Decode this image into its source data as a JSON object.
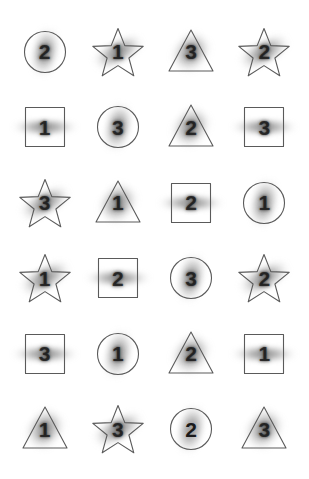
{
  "canvas": {
    "width": 309,
    "height": 479,
    "background_color": "#ffffff",
    "outline_color": "#5a5a5a",
    "digit_color": "#1d1d1d"
  },
  "grid": {
    "rows": 6,
    "columns": 4,
    "total_cells": 24
  },
  "cells": [
    {
      "row": 1,
      "col": 1,
      "shape": "circle",
      "digit": "2",
      "blur": "blurred",
      "smudge": "sm-b"
    },
    {
      "row": 1,
      "col": 2,
      "shape": "star",
      "digit": "1",
      "blur": "blurred",
      "smudge": "sm-a"
    },
    {
      "row": 1,
      "col": 3,
      "shape": "triangle",
      "digit": "3",
      "blur": "blurred",
      "smudge": "sm-d"
    },
    {
      "row": 1,
      "col": 4,
      "shape": "star",
      "digit": "2",
      "blur": "blurred",
      "smudge": "sm-a"
    },
    {
      "row": 2,
      "col": 1,
      "shape": "square",
      "digit": "1",
      "blur": "blurred",
      "smudge": "sm-c"
    },
    {
      "row": 2,
      "col": 2,
      "shape": "circle",
      "digit": "3",
      "blur": "blurred",
      "smudge": "sm-b"
    },
    {
      "row": 2,
      "col": 3,
      "shape": "triangle",
      "digit": "2",
      "blur": "blurred",
      "smudge": "sm-d"
    },
    {
      "row": 2,
      "col": 4,
      "shape": "square",
      "digit": "3",
      "blur": "blurred",
      "smudge": "sm-c"
    },
    {
      "row": 3,
      "col": 1,
      "shape": "star",
      "digit": "3",
      "blur": "blurred",
      "smudge": "sm-a"
    },
    {
      "row": 3,
      "col": 2,
      "shape": "triangle",
      "digit": "1",
      "blur": "blurred",
      "smudge": "sm-d"
    },
    {
      "row": 3,
      "col": 3,
      "shape": "square",
      "digit": "2",
      "blur": "blurred",
      "smudge": "sm-c"
    },
    {
      "row": 3,
      "col": 4,
      "shape": "circle",
      "digit": "1",
      "blur": "blurred",
      "smudge": "sm-b"
    },
    {
      "row": 4,
      "col": 1,
      "shape": "star",
      "digit": "1",
      "blur": "blurred",
      "smudge": "sm-a"
    },
    {
      "row": 4,
      "col": 2,
      "shape": "square",
      "digit": "2",
      "blur": "blurred",
      "smudge": "sm-c"
    },
    {
      "row": 4,
      "col": 3,
      "shape": "circle",
      "digit": "3",
      "blur": "blurred",
      "smudge": "sm-b"
    },
    {
      "row": 4,
      "col": 4,
      "shape": "star",
      "digit": "2",
      "blur": "blurred",
      "smudge": "sm-a"
    },
    {
      "row": 5,
      "col": 1,
      "shape": "square",
      "digit": "3",
      "blur": "blurred",
      "smudge": "sm-c"
    },
    {
      "row": 5,
      "col": 2,
      "shape": "circle",
      "digit": "1",
      "blur": "blurred",
      "smudge": "sm-b"
    },
    {
      "row": 5,
      "col": 3,
      "shape": "triangle",
      "digit": "2",
      "blur": "blurred",
      "smudge": "sm-d"
    },
    {
      "row": 5,
      "col": 4,
      "shape": "square",
      "digit": "1",
      "blur": "blurred",
      "smudge": "sm-c"
    },
    {
      "row": 6,
      "col": 1,
      "shape": "triangle",
      "digit": "1",
      "blur": "blurred",
      "smudge": "sm-d"
    },
    {
      "row": 6,
      "col": 2,
      "shape": "star",
      "digit": "3",
      "blur": "blurred",
      "smudge": "sm-a"
    },
    {
      "row": 6,
      "col": 3,
      "shape": "circle",
      "digit": "2",
      "blur": "sharp",
      "smudge": "sm-b"
    },
    {
      "row": 6,
      "col": 4,
      "shape": "triangle",
      "digit": "3",
      "blur": "blurred",
      "smudge": "sm-d"
    }
  ]
}
